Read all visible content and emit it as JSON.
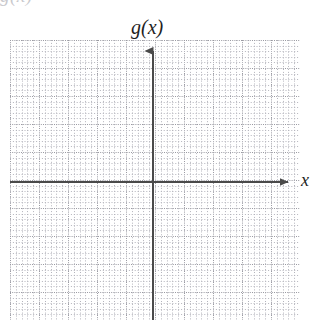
{
  "figure": {
    "title": "",
    "background_color": "#ffffff",
    "width": 332,
    "height": 332,
    "clipped_top_fragment": "g(x)"
  },
  "labels": {
    "y_axis_function_label": "g(x)",
    "x_axis_label": "x"
  },
  "colors": {
    "axis": "#4a4a4a",
    "grid_major": "#9a9aa2",
    "grid_minor": "#b4b4bc",
    "label_text": "#1f1f1f",
    "background": "#ffffff"
  },
  "chart_data": {
    "type": "line",
    "title": "",
    "subtitle": "",
    "xlabel": "x",
    "ylabel": "g(x)",
    "series": [],
    "categories": [],
    "x": [],
    "values": [],
    "annotations": [],
    "legend": {
      "entries": [],
      "position": "none"
    },
    "grid": {
      "visible": true,
      "style": "dotted",
      "minor_cells_per_major": 5,
      "major_cells_x": 10,
      "major_cells_y": 10,
      "minor_cells_x": 50,
      "minor_cells_y": 50
    },
    "axes": {
      "x_axis_visible": true,
      "y_axis_visible": true,
      "x_arrowhead": "right",
      "y_arrowhead": "up",
      "tick_labels_x": [],
      "tick_labels_y": [],
      "origin_in_view": true
    },
    "xlim": [
      -5,
      5
    ],
    "ylim": [
      -5,
      5
    ]
  }
}
